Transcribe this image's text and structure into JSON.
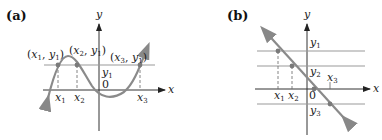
{
  "panels": [
    {
      "label": "(a)",
      "axis_x": "x",
      "axis_y": "y",
      "origin": "0",
      "horizontal_line_label": "y1",
      "points": [
        {
          "label": "(x1, y1)",
          "x_label": "x1"
        },
        {
          "label": "(x2, y1)",
          "x_label": "x2"
        },
        {
          "label": "(x3, y1)",
          "x_label": "x3"
        }
      ],
      "curve": "cubic"
    },
    {
      "label": "(b)",
      "axis_x": "x",
      "axis_y": "y",
      "origin": "0",
      "horizontal_lines": [
        "y1",
        "y2",
        "y3"
      ],
      "x_labels": [
        "x1",
        "x2",
        "x3"
      ],
      "curve": "decreasing-line"
    }
  ],
  "colors": {
    "curve": "#8a8a8a",
    "axis": "#333333",
    "guide": "#999999",
    "dot": "#7a7a7a"
  }
}
